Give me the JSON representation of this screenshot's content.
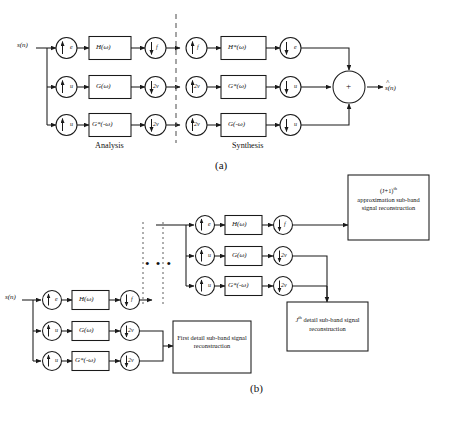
{
  "figure": {
    "caption_a": "(a)",
    "caption_b": "(b)"
  },
  "panel_a": {
    "input_label": "s(n)",
    "output_label": "s(n)",
    "output_hat": "^",
    "section_left": "Analysis",
    "section_right": "Synthesis",
    "sum_symbol": "+",
    "analysis_rows": [
      {
        "up": "e",
        "filter": "H(ω)",
        "down": "f"
      },
      {
        "up": "u",
        "filter": "G(ω)",
        "down": "2v"
      },
      {
        "up": "u",
        "filter": "G*(-ω)",
        "down": "2v"
      }
    ],
    "synthesis_rows": [
      {
        "up": "f",
        "filter": "H*(ω)",
        "down": "e"
      },
      {
        "up": "2v",
        "filter": "G*(ω)",
        "down": "u"
      },
      {
        "up": "2v",
        "filter": "G(-ω)",
        "down": "u"
      }
    ]
  },
  "panel_b": {
    "input_label": "s(n)",
    "ellipsis": "• • •",
    "stage_first": [
      {
        "up": "e",
        "filter": "H(ω)",
        "down": "f"
      },
      {
        "up": "u",
        "filter": "G(ω)",
        "down": "2v"
      },
      {
        "up": "u",
        "filter": "G*(-ω)",
        "down": "2v"
      }
    ],
    "stage_last": [
      {
        "up": "e",
        "filter": "H(ω)",
        "down": "f"
      },
      {
        "up": "u",
        "filter": "G(ω)",
        "down": "2v"
      },
      {
        "up": "u",
        "filter": "G*(-ω)",
        "down": "2v"
      }
    ],
    "box_first_detail": "First detail sub-band signal reconstruction",
    "box_approximation_line1": "(J+1)",
    "box_approximation_sup": "th",
    "box_approximation_rest": "approximation sub-band signal reconstruction",
    "box_jth_detail_lead": "J",
    "box_jth_detail_sup": "th",
    "box_jth_detail_rest": " detail sub-band signal reconstruction"
  },
  "colors": {
    "stroke": "#1a1a1a",
    "background": "#ffffff",
    "dash": "#555555"
  }
}
